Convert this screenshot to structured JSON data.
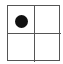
{
  "board": {
    "rows": 2,
    "cols": 2,
    "cells": [
      {
        "row": 0,
        "col": 0,
        "piece": "black-stone"
      },
      {
        "row": 0,
        "col": 1,
        "piece": ""
      },
      {
        "row": 1,
        "col": 0,
        "piece": ""
      },
      {
        "row": 1,
        "col": 1,
        "piece": ""
      }
    ],
    "colors": {
      "line": "#555555",
      "stone": "#111111",
      "background": "#ffffff"
    }
  }
}
